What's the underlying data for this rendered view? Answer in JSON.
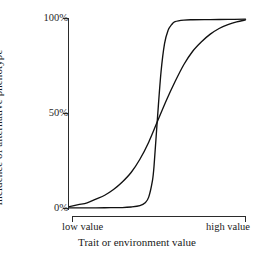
{
  "chart_data": {
    "type": "line",
    "title": "",
    "xlabel": "Trait or environment value",
    "ylabel": "Incidence of alternative phenotype",
    "xlim": [
      0,
      1
    ],
    "ylim": [
      0,
      100
    ],
    "grid": false,
    "legend": "none",
    "x_tick_labels": [
      "low value",
      "high value"
    ],
    "y_tick_labels": [
      "0%",
      "50%",
      "100%"
    ],
    "y_ticks": [
      0,
      50,
      100
    ],
    "axis_style": "bracket",
    "line_color": "#111111",
    "background_color": "#ffffff",
    "series": [
      {
        "name": "gradual reaction norm",
        "description": "shallow logistic curve, gradual transition across trait range",
        "x": [
          0.0,
          0.05,
          0.1,
          0.15,
          0.2,
          0.25,
          0.3,
          0.35,
          0.4,
          0.45,
          0.5,
          0.55,
          0.6,
          0.65,
          0.7,
          0.75,
          0.8,
          0.85,
          0.9,
          0.95,
          1.0
        ],
        "values": [
          1,
          2,
          3,
          5,
          7,
          10,
          14,
          19,
          26,
          35,
          46,
          57,
          67,
          76,
          83,
          88,
          92,
          95,
          97,
          98.5,
          99.5
        ]
      },
      {
        "name": "threshold reaction norm",
        "description": "steep logistic curve, near step-function switch at mid trait value",
        "x": [
          0.0,
          0.1,
          0.2,
          0.3,
          0.35,
          0.4,
          0.43,
          0.45,
          0.47,
          0.48,
          0.5,
          0.52,
          0.54,
          0.56,
          0.58,
          0.6,
          0.65,
          0.7,
          0.8,
          0.9,
          1.0
        ],
        "values": [
          0.3,
          0.3,
          0.4,
          0.5,
          0.8,
          1.5,
          3,
          6,
          14,
          22,
          48,
          72,
          87,
          94,
          97,
          98.6,
          99.4,
          99.6,
          99.7,
          99.8,
          99.9
        ]
      }
    ],
    "annotations": [
      {
        "text": "curves intersect near 50% at mid trait value",
        "x": 0.5,
        "y": 50
      }
    ]
  },
  "axes": {
    "y_tick_100": "100%",
    "y_tick_50": "50%",
    "y_tick_0": "0%",
    "y_title": "Incidence of alternative phenotype",
    "x_tick_low": "low value",
    "x_tick_high": "high value",
    "x_title": "Trait or environment value"
  }
}
